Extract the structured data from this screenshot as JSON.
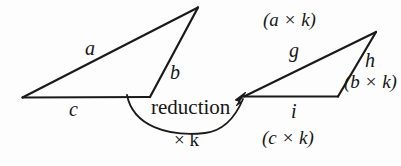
{
  "figure": {
    "background_color": "#fdfdfd",
    "stroke_color": "#1a1a1a",
    "width": 401,
    "height": 166
  },
  "source_triangle": {
    "name": "original-triangle",
    "side_a_label": "a",
    "side_b_label": "b",
    "side_c_label": "c"
  },
  "target_triangle": {
    "name": "reduced-triangle",
    "side_g_label": "g",
    "side_h_label": "h",
    "side_i_label": "i",
    "side_g_expression": "(a × k)",
    "side_h_expression": "(b × k)",
    "side_i_expression": "(c × k)"
  },
  "transform": {
    "operation_label": "reduction",
    "factor_label": "× k",
    "factor_symbol": "×",
    "factor_variable": "k"
  }
}
